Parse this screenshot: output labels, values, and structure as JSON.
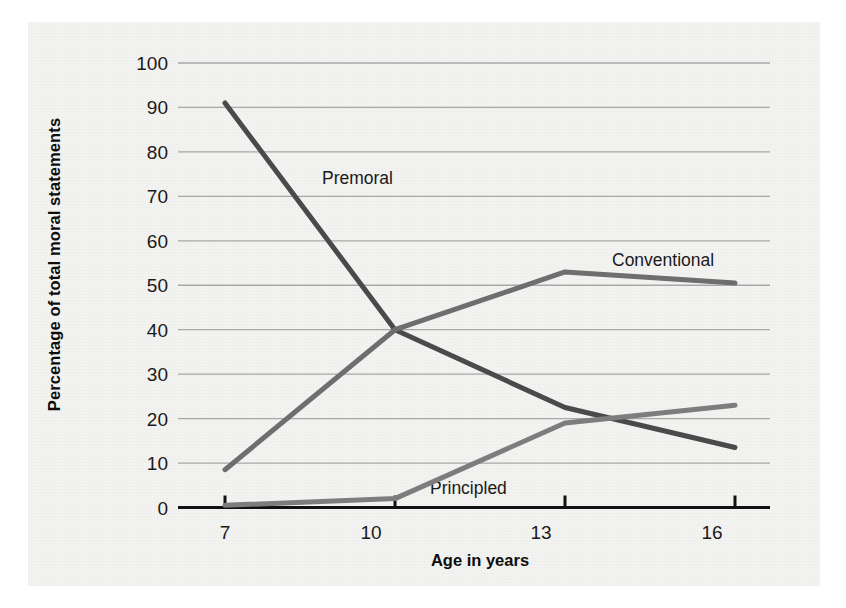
{
  "figure": {
    "background_color": "#f3f3f1",
    "page_color": "#ffffff"
  },
  "chart_data": {
    "type": "line",
    "title": "",
    "xlabel": "Age in years",
    "ylabel": "Percentage of total moral statements",
    "x": [
      7,
      10,
      13,
      16
    ],
    "categories": [
      "7",
      "10",
      "13",
      "16"
    ],
    "xlim": [
      7,
      16
    ],
    "ylim": [
      0,
      100
    ],
    "yticks": [
      0,
      10,
      20,
      30,
      40,
      50,
      60,
      70,
      80,
      90,
      100
    ],
    "ytick_labels": [
      "0",
      "10",
      "20",
      "30",
      "40",
      "50",
      "60",
      "70",
      "80",
      "90",
      "100"
    ],
    "xtick_labels": [
      "7",
      "10",
      "13",
      "16"
    ],
    "grid": "horizontal",
    "grid_color": "#a8a8a8",
    "legend": "inline-labels",
    "series": [
      {
        "name": "Premoral",
        "values": [
          91,
          40,
          22.5,
          13.5
        ],
        "color": "#4a4a4a",
        "label_x": 7.9,
        "label_y": 72.5
      },
      {
        "name": "Conventional",
        "values": [
          8.5,
          40,
          53,
          50.5
        ],
        "color": "#6e6e6e",
        "label_x": 13.5,
        "label_y": 55.5
      },
      {
        "name": "Principled",
        "values": [
          0.5,
          2,
          19,
          23
        ],
        "color": "#7d7d7d",
        "label_x": 11.0,
        "label_y": 3.5
      }
    ],
    "annotations": [
      {
        "text": "Premoral",
        "series": "Premoral"
      },
      {
        "text": "Conventional",
        "series": "Conventional"
      },
      {
        "text": "Principled",
        "series": "Principled"
      }
    ]
  },
  "axes": {
    "y_title": "Percentage of total moral statements",
    "x_title": "Age in years",
    "y_tick_0": "0",
    "y_tick_10": "10",
    "y_tick_20": "20",
    "y_tick_30": "30",
    "y_tick_40": "40",
    "y_tick_50": "50",
    "y_tick_60": "60",
    "y_tick_70": "70",
    "y_tick_80": "80",
    "y_tick_90": "90",
    "y_tick_100": "100",
    "x_tick_7": "7",
    "x_tick_10": "10",
    "x_tick_13": "13",
    "x_tick_16": "16"
  },
  "labels": {
    "premoral": "Premoral",
    "conventional": "Conventional",
    "principled": "Principled"
  }
}
